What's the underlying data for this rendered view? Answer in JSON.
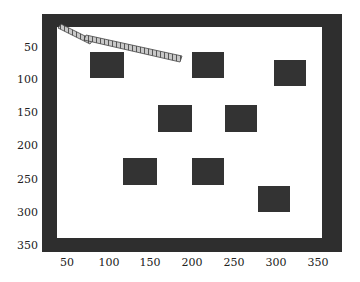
{
  "scene": {
    "obstacles": [
      {
        "x": 90,
        "y": 52,
        "w": 34,
        "h": 26
      },
      {
        "x": 192,
        "y": 52,
        "w": 32,
        "h": 26
      },
      {
        "x": 274,
        "y": 60,
        "w": 32,
        "h": 26
      },
      {
        "x": 158,
        "y": 105,
        "w": 34,
        "h": 27
      },
      {
        "x": 225,
        "y": 105,
        "w": 32,
        "h": 27
      },
      {
        "x": 123,
        "y": 158,
        "w": 34,
        "h": 27
      },
      {
        "x": 192,
        "y": 158,
        "w": 32,
        "h": 27
      },
      {
        "x": 258,
        "y": 186,
        "w": 32,
        "h": 26
      }
    ],
    "colors": {
      "wall": "#2e2e2e",
      "obstacle": "#333333",
      "arm": "#bdbdbd"
    }
  },
  "axes": {
    "y_ticks": [
      {
        "label": "50",
        "y": 41
      },
      {
        "label": "100",
        "y": 73
      },
      {
        "label": "150",
        "y": 106
      },
      {
        "label": "200",
        "y": 139
      },
      {
        "label": "250",
        "y": 173
      },
      {
        "label": "300",
        "y": 206
      },
      {
        "label": "350",
        "y": 239
      }
    ],
    "x_ticks": [
      {
        "label": "50",
        "x": 67
      },
      {
        "label": "100",
        "x": 109
      },
      {
        "label": "150",
        "x": 150
      },
      {
        "label": "200",
        "x": 192
      },
      {
        "label": "250",
        "x": 234
      },
      {
        "label": "300",
        "x": 276
      },
      {
        "label": "350",
        "x": 318
      }
    ]
  }
}
